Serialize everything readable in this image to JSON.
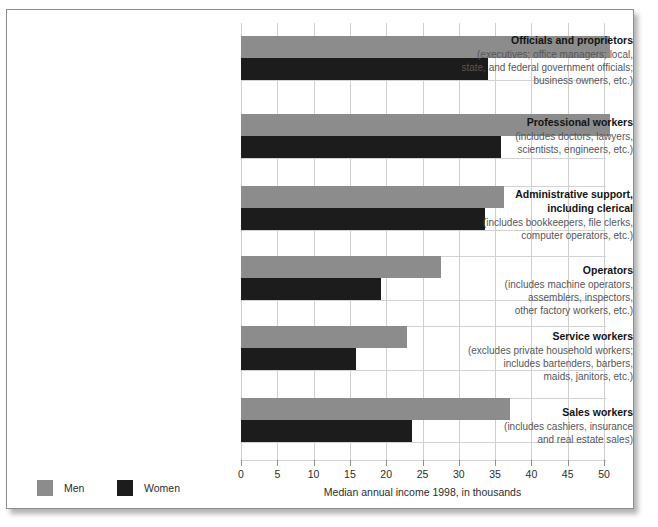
{
  "chart_data": {
    "type": "bar",
    "orientation": "horizontal",
    "title": "",
    "xlabel": "Median annual income 1998, in thousands",
    "ylabel": "",
    "xlim": [
      0,
      50
    ],
    "xticks": [
      0,
      5,
      10,
      15,
      20,
      25,
      30,
      35,
      40,
      45,
      50
    ],
    "xtick_labels": [
      "0",
      "5",
      "10",
      "15",
      "20",
      "25",
      "30",
      "35",
      "40",
      "45",
      "50"
    ],
    "grid": "vertical",
    "legend_position": "bottom-left",
    "colors": {
      "men": "#8c8c8c",
      "women": "#1c1c1c"
    },
    "categories": [
      "Officials and proprietors",
      "Professional workers",
      "Administrative support, including clerical",
      "Operators",
      "Service workers",
      "Sales workers"
    ],
    "series": [
      {
        "name": "Men",
        "values": [
          50.8,
          50.8,
          36.2,
          27.6,
          22.8,
          37.0
        ]
      },
      {
        "name": "Women",
        "values": [
          34.0,
          35.8,
          33.6,
          19.3,
          15.9,
          23.5
        ]
      }
    ]
  },
  "legend": {
    "items": [
      {
        "label": "Men",
        "color": "#8c8c8c"
      },
      {
        "label": "Women",
        "color": "#1c1c1c"
      }
    ]
  },
  "axis": {
    "title": "Median annual income 1998, in thousands",
    "ticks": [
      "0",
      "5",
      "10",
      "15",
      "20",
      "25",
      "30",
      "35",
      "40",
      "45",
      "50"
    ]
  },
  "categories": [
    {
      "title": "Officials and proprietors",
      "sub": [
        "(executives; office managers; local,",
        "state, and federal government officials;",
        "business owners, etc.)"
      ],
      "men": 50.8,
      "women": 34.0
    },
    {
      "title": "Professional workers",
      "sub": [
        "(includes doctors, lawyers,",
        "scientists, engineers, etc.)"
      ],
      "men": 50.8,
      "women": 35.8
    },
    {
      "title": "Administrative support,",
      "title2": "including clerical",
      "sub": [
        "(includes bookkeepers, file clerks,",
        "computer operators, etc.)"
      ],
      "men": 36.2,
      "women": 33.6
    },
    {
      "title": "Operators",
      "sub": [
        "(includes machine operators,",
        "assemblers, inspectors,",
        "other factory workers, etc.)"
      ],
      "men": 27.6,
      "women": 19.3
    },
    {
      "title": "Service workers",
      "sub": [
        "(excludes private household workers;",
        "includes bartenders, barbers,",
        "maids, janitors, etc.)"
      ],
      "men": 22.8,
      "women": 15.9
    },
    {
      "title": "Sales workers",
      "sub": [
        "(includes cashiers, insurance",
        "and real estate sales)"
      ],
      "men": 37.0,
      "women": 23.5
    }
  ]
}
